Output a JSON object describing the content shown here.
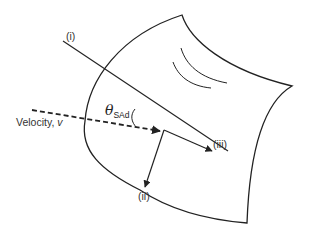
{
  "diagram": {
    "colors": {
      "stroke": "#222222",
      "text": "#333333",
      "background": "#ffffff"
    },
    "labels": {
      "line_i": "(i)",
      "arrow_ii": "(ii)",
      "arrow_iii": "(iii)",
      "velocity_prefix": "Velocity, ",
      "velocity_var": "v",
      "angle_symbol": "θ",
      "angle_subscript": "SAd"
    },
    "elements": {
      "sheet": "curved surface outline with two crease marks",
      "velocity_arrow": "dashed arrow pointing to impact point",
      "line_i": "solid line through impact point (surface tangent)",
      "arrow_ii": "solid arrow from impact point downward-left",
      "arrow_iii": "solid arrow from impact point to the right along line (i)",
      "angle_arc": "arc marking angle between velocity and line (i)"
    }
  }
}
